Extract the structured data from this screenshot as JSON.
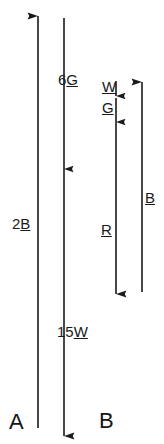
{
  "figure": {
    "type": "free-body-vector-diagram",
    "background_color": "#ffffff",
    "stroke_color": "#1a1a1a",
    "width": 164,
    "height": 444
  },
  "groups": [
    {
      "key": "a",
      "label": "A",
      "label_x": 9,
      "label_y": 411,
      "label_size": 22
    },
    {
      "key": "b",
      "label": "B",
      "label_x": 99,
      "label_y": 410,
      "label_size": 22
    }
  ],
  "vectors": [
    {
      "name": "a-2b-up-arrow",
      "group": "a",
      "x": 38,
      "y_tail": 428,
      "y_head": 16,
      "direction": "up",
      "arrowhead": true,
      "label_prefix": "2",
      "label_vector": "B",
      "label_x": 12,
      "label_y": 216,
      "label_size": 15
    },
    {
      "name": "a-6g-15w-down-arrow",
      "group": "a",
      "x": 64,
      "y_tail": 18,
      "y_head": 436,
      "direction": "down",
      "arrowhead": true,
      "mid_arrowhead_y": 169,
      "label_prefix": "6",
      "label_vector": "G",
      "label_x": 58,
      "label_y": 72,
      "label_size": 15,
      "label2_prefix": "15",
      "label2_vector": "W",
      "label2_x": 57,
      "label2_y": 324,
      "label2_size": 15
    },
    {
      "name": "b-w-short-down-arrow",
      "group": "b",
      "x": 116,
      "y_tail": 81,
      "y_head": 96,
      "direction": "down",
      "arrowhead": true,
      "label_vector": "W",
      "label_x": 102,
      "label_y": 79,
      "label_size": 15
    },
    {
      "name": "b-g-short-down-arrow",
      "group": "b",
      "x": 116,
      "y_tail": 98,
      "y_head": 122,
      "direction": "down",
      "arrowhead": true,
      "label_vector": "G",
      "label_x": 102,
      "label_y": 100,
      "label_size": 15
    },
    {
      "name": "b-r-long-down-arrow",
      "group": "b",
      "x": 116,
      "y_tail": 122,
      "y_head": 294,
      "direction": "down",
      "arrowhead": true,
      "label_vector": "R",
      "label_x": 101,
      "label_y": 222,
      "label_size": 15
    },
    {
      "name": "b-b-up-arrow",
      "group": "b",
      "x": 142,
      "y_tail": 292,
      "y_head": 82,
      "direction": "up",
      "arrowhead": true,
      "label_vector": "B",
      "label_x": 145,
      "label_y": 190,
      "label_size": 15
    }
  ]
}
